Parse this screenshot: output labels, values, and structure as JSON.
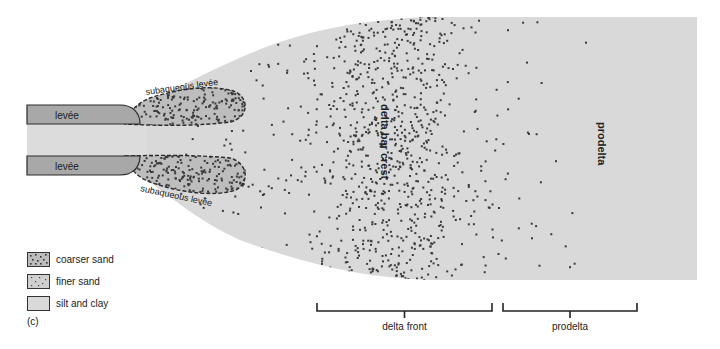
{
  "colors": {
    "background": "#ffffff",
    "silt_clay": "#d9d9d9",
    "levee": "#a8a8a8",
    "channel": "#dcdcdc",
    "dot": "#3a3a3a",
    "outline": "#2a2a2a"
  },
  "labels": {
    "levee_top": "levée",
    "levee_bottom": "levée",
    "subaqueous_top": "subaqueous levée",
    "subaqueous_bottom": "subaqueous levée",
    "delta_bar_crest": "delta bar crest",
    "prodelta_vertical": "prodelta"
  },
  "brackets": [
    {
      "label": "delta front",
      "x1": 317,
      "x2": 492
    },
    {
      "label": "prodelta",
      "x1": 503,
      "x2": 637
    }
  ],
  "legend": {
    "items": [
      {
        "key": "coarser-sand",
        "label": "coarser sand"
      },
      {
        "key": "finer-sand",
        "label": "finer sand"
      },
      {
        "key": "silt-clay",
        "label": "silt and clay"
      }
    ],
    "caption": "(c)"
  }
}
